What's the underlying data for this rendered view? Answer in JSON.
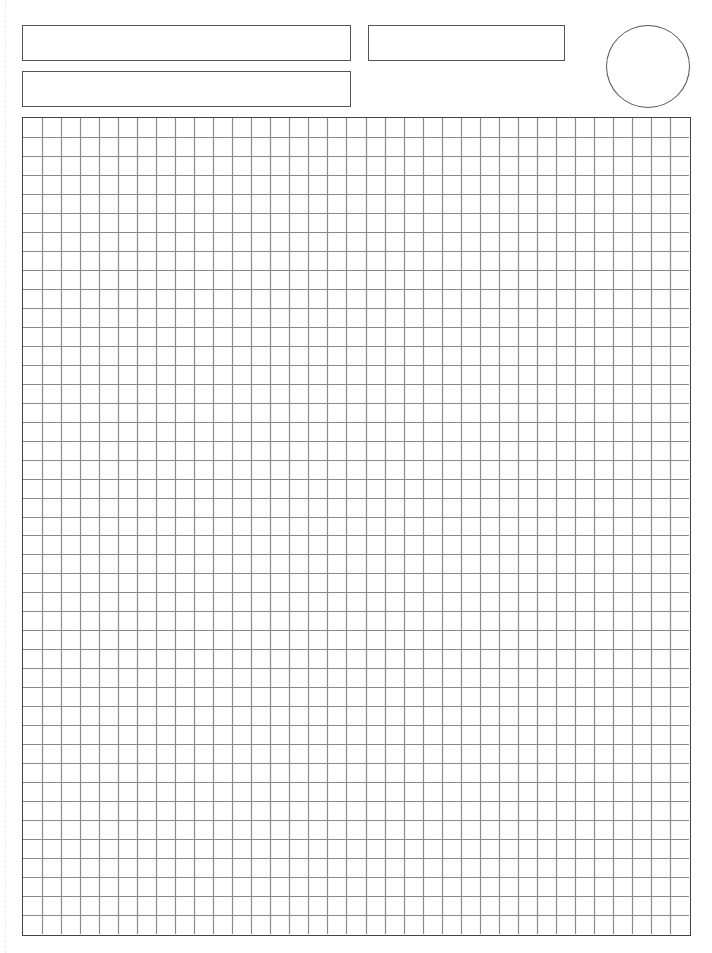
{
  "page": {
    "type": "grid-paper-template",
    "background": "#ffffff",
    "line_color": "#8a8a8a",
    "border_color": "#444444"
  },
  "header": {
    "field_1": {
      "label": "",
      "value": ""
    },
    "field_2": {
      "label": "",
      "value": ""
    },
    "field_3": {
      "label": "",
      "value": ""
    },
    "badge_circle": {
      "value": ""
    }
  },
  "grid": {
    "columns": 35,
    "rows": 43,
    "cell_size_px": 19.1
  }
}
